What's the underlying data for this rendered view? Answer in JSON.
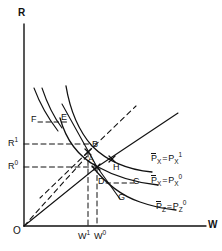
{
  "figure": {
    "type": "economics-factor-price-diagram",
    "axes": {
      "y_label": "R",
      "x_label": "W",
      "origin_label": "O"
    },
    "tick_labels": {
      "y": [
        {
          "id": "R1",
          "base": "R",
          "sup": "1"
        },
        {
          "id": "R0",
          "base": "R",
          "sup": "0"
        }
      ],
      "x": [
        {
          "id": "W1",
          "base": "W",
          "sup": "1"
        },
        {
          "id": "W0",
          "base": "W",
          "sup": "0"
        }
      ]
    },
    "points": [
      {
        "id": "A",
        "label": "A"
      },
      {
        "id": "B",
        "label": "B"
      },
      {
        "id": "C",
        "label": "C"
      },
      {
        "id": "D",
        "label": "D"
      },
      {
        "id": "E",
        "label": "E"
      },
      {
        "id": "F",
        "label": "F"
      },
      {
        "id": "G",
        "label": "G"
      },
      {
        "id": "H",
        "label": "H"
      }
    ],
    "curve_labels": [
      {
        "id": "px1",
        "lhs_base": "P",
        "lhs_sub": "X",
        "lhs_overbar": true,
        "eq": "=",
        "rhs_base": "P",
        "rhs_sub": "X",
        "rhs_sup": "1"
      },
      {
        "id": "px0",
        "lhs_base": "P",
        "lhs_sub": "X",
        "lhs_overbar": true,
        "eq": "=",
        "rhs_base": "P",
        "rhs_sub": "X",
        "rhs_sup": "0"
      },
      {
        "id": "pz0",
        "lhs_base": "P",
        "lhs_sub": "Z",
        "lhs_overbar": true,
        "eq": "=",
        "rhs_base": "P",
        "rhs_sub": "Z",
        "rhs_sup": "0"
      }
    ],
    "colors": {
      "ink": "#111111",
      "background": "#ffffff"
    }
  }
}
